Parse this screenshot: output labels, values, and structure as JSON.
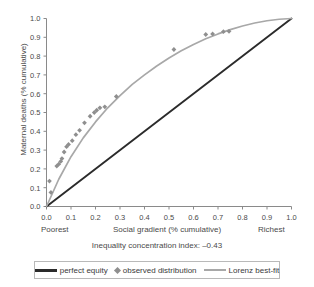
{
  "chart_data": {
    "type": "scatter",
    "title": "",
    "caption": "Inequality concentration index: –0.43",
    "xlabel": "Social gradient (% cumulative)",
    "ylabel": "Maternal deaths (% cumulative)",
    "x_low_label": "Poorest",
    "x_high_label": "Richest",
    "xlim": [
      0,
      1
    ],
    "ylim": [
      0,
      1
    ],
    "xticks": [
      "0.0",
      "0.1",
      "0.2",
      "0.3",
      "0.4",
      "0.5",
      "0.6",
      "0.7",
      "0.8",
      "0.9",
      "1.0"
    ],
    "yticks": [
      "0.0",
      "0.1",
      "0.2",
      "0.3",
      "0.4",
      "0.5",
      "0.6",
      "0.7",
      "0.8",
      "0.9",
      "1.0"
    ],
    "grid": false,
    "legend_position": "bottom",
    "series": [
      {
        "name": "perfect equity",
        "type": "line",
        "color": "#2b2b2b",
        "x": [
          0.0,
          1.0
        ],
        "y": [
          0.0,
          1.0
        ]
      },
      {
        "name": "Lorenz best-fit",
        "type": "line",
        "color": "#a8a8a8",
        "x": [
          0.0,
          0.05,
          0.1,
          0.15,
          0.2,
          0.25,
          0.3,
          0.35,
          0.4,
          0.45,
          0.5,
          0.55,
          0.6,
          0.65,
          0.7,
          0.75,
          0.8,
          0.85,
          0.9,
          0.95,
          1.0
        ],
        "y": [
          0.0,
          0.145,
          0.265,
          0.365,
          0.45,
          0.525,
          0.59,
          0.65,
          0.7,
          0.747,
          0.79,
          0.828,
          0.862,
          0.892,
          0.918,
          0.941,
          0.96,
          0.976,
          0.988,
          0.996,
          1.0
        ]
      },
      {
        "name": "observed distribution",
        "type": "scatter",
        "color": "#8f8f8f",
        "points": [
          [
            0.012,
            0.135
          ],
          [
            0.018,
            0.075
          ],
          [
            0.042,
            0.215
          ],
          [
            0.05,
            0.225
          ],
          [
            0.058,
            0.24
          ],
          [
            0.063,
            0.255
          ],
          [
            0.072,
            0.29
          ],
          [
            0.082,
            0.318
          ],
          [
            0.09,
            0.33
          ],
          [
            0.105,
            0.35
          ],
          [
            0.12,
            0.382
          ],
          [
            0.135,
            0.405
          ],
          [
            0.155,
            0.445
          ],
          [
            0.178,
            0.48
          ],
          [
            0.195,
            0.5
          ],
          [
            0.205,
            0.512
          ],
          [
            0.218,
            0.525
          ],
          [
            0.238,
            0.53
          ],
          [
            0.285,
            0.585
          ],
          [
            0.52,
            0.835
          ],
          [
            0.65,
            0.915
          ],
          [
            0.678,
            0.918
          ],
          [
            0.722,
            0.93
          ],
          [
            0.745,
            0.932
          ]
        ]
      }
    ]
  },
  "legend": {
    "items": [
      {
        "label": "perfect equity",
        "marker": "line-dark"
      },
      {
        "label": "observed distribution",
        "marker": "diamond"
      },
      {
        "label": "Lorenz best-fit",
        "marker": "line-light"
      }
    ]
  }
}
